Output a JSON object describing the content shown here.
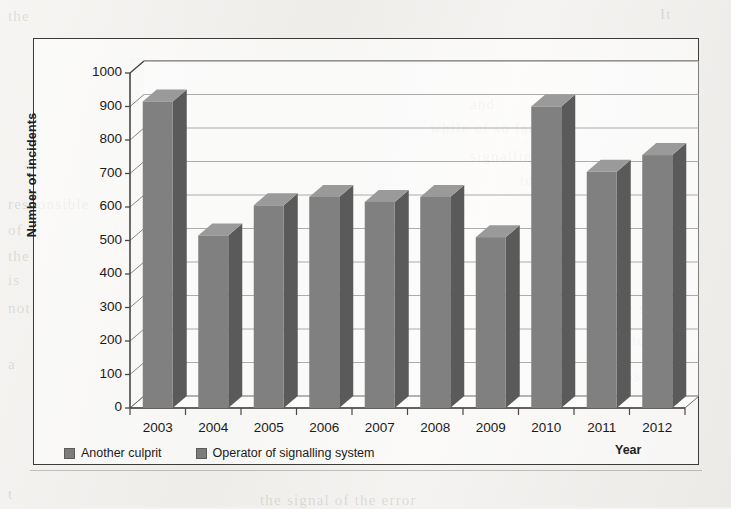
{
  "chart_data": {
    "type": "bar",
    "title": "",
    "xlabel": "Year",
    "ylabel": "Number of incidents",
    "categories": [
      "2003",
      "2004",
      "2005",
      "2006",
      "2007",
      "2008",
      "2009",
      "2010",
      "2011",
      "2012"
    ],
    "values": [
      915,
      515,
      605,
      630,
      615,
      630,
      510,
      900,
      705,
      755
    ],
    "series": [
      {
        "name": "Operator of signalling system",
        "values": [
          915,
          515,
          605,
          630,
          615,
          630,
          510,
          900,
          705,
          755
        ]
      }
    ],
    "ylim": [
      0,
      1000
    ],
    "ytick_step": 100,
    "yticks": [
      "0",
      "100",
      "200",
      "300",
      "400",
      "500",
      "600",
      "700",
      "800",
      "900",
      "1000"
    ],
    "grid": true,
    "legend_position": "bottom-left",
    "legend": [
      "Another culprit",
      "Operator of signalling system"
    ],
    "style": "3d-column",
    "colors": {
      "bar_front": "#808080",
      "bar_side": "#5a5a5a",
      "bar_top": "#9a9a9a",
      "grid": "#6e6b68",
      "axis": "#4a4745",
      "frame": "#3d3b39",
      "text": "#1d1a18"
    }
  },
  "legend": {
    "items": [
      {
        "label": "Another culprit"
      },
      {
        "label": "Operator of signalling system"
      }
    ]
  },
  "bleed_through": [
    {
      "text": "the",
      "x": 8,
      "y": 8
    },
    {
      "text": "It",
      "x": 660,
      "y": 6
    },
    {
      "text": "and",
      "x": 470,
      "y": 96
    },
    {
      "text": "while of so far was",
      "x": 430,
      "y": 120
    },
    {
      "text": "signalling",
      "x": 470,
      "y": 148
    },
    {
      "text": "to",
      "x": 520,
      "y": 172
    },
    {
      "text": "responsible",
      "x": 8,
      "y": 196
    },
    {
      "text": "of",
      "x": 8,
      "y": 222
    },
    {
      "text": "the",
      "x": 8,
      "y": 248
    },
    {
      "text": "is",
      "x": 8,
      "y": 272
    },
    {
      "text": "not",
      "x": 8,
      "y": 300
    },
    {
      "text": "the system",
      "x": 612,
      "y": 300
    },
    {
      "text": "incidents",
      "x": 610,
      "y": 332
    },
    {
      "text": "a",
      "x": 8,
      "y": 356
    },
    {
      "text": "was",
      "x": 614,
      "y": 368
    },
    {
      "text": "t",
      "x": 8,
      "y": 486
    },
    {
      "text": "the signal of the error",
      "x": 260,
      "y": 492
    }
  ]
}
